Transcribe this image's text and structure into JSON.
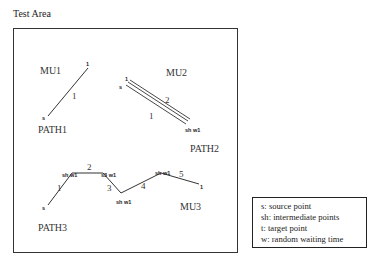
{
  "title": "Test Area",
  "units": [
    {
      "label": "MU1",
      "path": "PATH1",
      "x": 40,
      "y": 74,
      "path_x": 38,
      "path_y": 133
    },
    {
      "label": "MU2",
      "path": "PATH2",
      "x": 166,
      "y": 76,
      "path_x": 190,
      "path_y": 152
    },
    {
      "label": "MU3",
      "path": "PATH3",
      "x": 180,
      "y": 210,
      "path_x": 38,
      "path_y": 231
    }
  ],
  "paths": {
    "path1": {
      "points": [
        [
          48,
          116
        ],
        [
          88,
          68
        ]
      ],
      "source_label": "s",
      "target_label": "1",
      "segments": [
        "1"
      ]
    },
    "path2": {
      "points": [
        [
          126,
          85
        ],
        [
          187,
          125
        ]
      ],
      "source_label": "s",
      "target_label": "1",
      "end_label": "sh w1",
      "segments": [
        "1",
        "2"
      ]
    },
    "path3": {
      "points": [
        [
          48,
          205
        ],
        [
          72,
          173
        ],
        [
          103,
          173
        ],
        [
          121,
          193
        ],
        [
          161,
          173
        ],
        [
          199,
          184
        ]
      ],
      "source_label": "s",
      "target_label": "1",
      "waypoint_labels": [
        "sh w1",
        "s3 w1",
        "sh w1",
        "sh w1"
      ],
      "segments": [
        "1",
        "2",
        "3",
        "4",
        "5"
      ]
    }
  },
  "legend": {
    "items": [
      "s: source point",
      "sh: intermediate points",
      "t: target point",
      "w: random waiting time"
    ]
  }
}
